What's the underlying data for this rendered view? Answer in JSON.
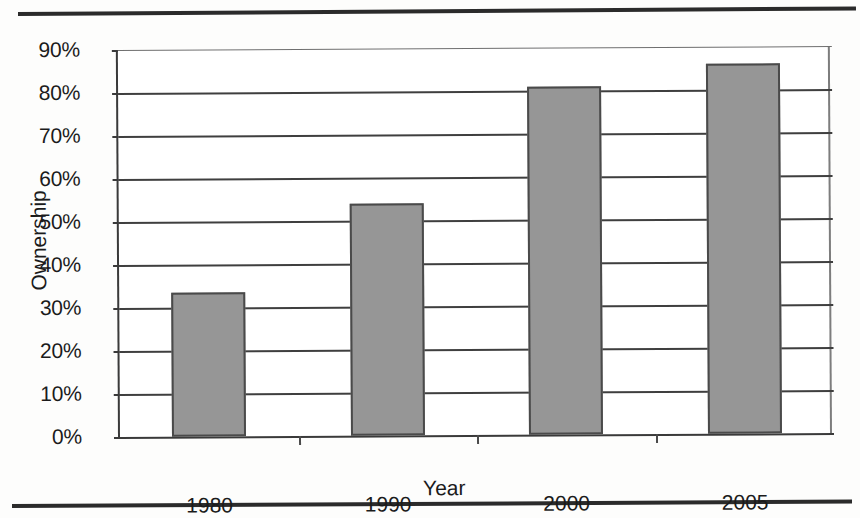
{
  "chart_data": {
    "type": "bar",
    "title": "",
    "xlabel": "Year",
    "ylabel": "Ownership",
    "categories": [
      "1980",
      "1990",
      "2000",
      "2005"
    ],
    "values": [
      33.5,
      54,
      81,
      86
    ],
    "value_unit": "%",
    "ylim": [
      0,
      90
    ],
    "ytick_values": [
      0,
      10,
      20,
      30,
      40,
      50,
      60,
      70,
      80,
      90
    ],
    "ytick_labels": [
      "0%",
      "10%",
      "20%",
      "30%",
      "40%",
      "50%",
      "60%",
      "70%",
      "80%",
      "90%"
    ],
    "grid": true,
    "legend": false,
    "legend_position": "none",
    "series": [
      {
        "name": "Ownership",
        "values": [
          33.5,
          54,
          81,
          86
        ],
        "color": "#969696"
      }
    ]
  },
  "style": {
    "bar_fill": "#969696",
    "bar_border": "#4a4a4a",
    "gridline_color": "#3f3f3f",
    "axis_color": "#3a3a3a",
    "text_color": "#1b1b1b",
    "page_background": "#fdfdfc",
    "rule_color": "#2b2b2b"
  }
}
